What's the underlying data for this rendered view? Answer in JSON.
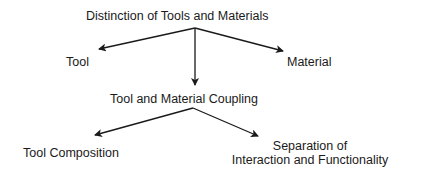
{
  "diagram": {
    "type": "tree",
    "nodes": {
      "root": "Distinction of Tools and Materials",
      "tool": "Tool",
      "material": "Material",
      "coupling": "Tool and Material Coupling",
      "composition": "Tool Composition",
      "separation_line1": "Separation of",
      "separation_line2": "Interaction and Functionality"
    },
    "edges": [
      {
        "from": "root",
        "to": "tool"
      },
      {
        "from": "root",
        "to": "material"
      },
      {
        "from": "root",
        "to": "coupling"
      },
      {
        "from": "coupling",
        "to": "composition"
      },
      {
        "from": "coupling",
        "to": "separation"
      }
    ],
    "colors": {
      "ink": "#1a1a1a",
      "background": "#ffffff"
    }
  }
}
